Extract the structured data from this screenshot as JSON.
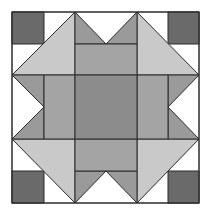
{
  "diagram": {
    "type": "quilt-block",
    "grid": {
      "cols": 6,
      "rows": 6,
      "x_lines": [
        12,
        44,
        75,
        106,
        137,
        168,
        199
      ],
      "y_lines": [
        12,
        44,
        75,
        107,
        139,
        171,
        203
      ]
    },
    "colors": {
      "background": "#ffffff",
      "corner_square": "#6a6a6a",
      "large_triangle": "#c9c9c9",
      "small_triangle": "#9a9a9a",
      "side_rect": "#a4a4a4",
      "center_square": "#8c8c8c",
      "outline": "#2a2a2a"
    },
    "pieces": {
      "corner_squares": [
        {
          "name": "corner-square-top-left",
          "points": "12,12 44,12 44,44 12,44"
        },
        {
          "name": "corner-square-top-right",
          "points": "168,12 199,12 199,44 168,44"
        },
        {
          "name": "corner-square-bottom-left",
          "points": "12,171 44,171 44,203 12,203"
        },
        {
          "name": "corner-square-bottom-right",
          "points": "168,171 199,171 199,203 168,203"
        }
      ],
      "large_triangles": [
        {
          "name": "large-triangle-top-left",
          "points": "75,12 12,75 75,75"
        },
        {
          "name": "large-triangle-top-right",
          "points": "137,12 199,75 137,75"
        },
        {
          "name": "large-triangle-bottom-left",
          "points": "12,139 75,139 75,203"
        },
        {
          "name": "large-triangle-bottom-right",
          "points": "137,139 199,139 137,203"
        }
      ],
      "small_triangles": [
        {
          "name": "small-triangle-top-a",
          "points": "75,12 106,44 75,44"
        },
        {
          "name": "small-triangle-top-b",
          "points": "137,12 137,44 106,44"
        },
        {
          "name": "small-triangle-bottom-a",
          "points": "75,171 106,171 75,203"
        },
        {
          "name": "small-triangle-bottom-b",
          "points": "106,171 137,171 137,203"
        },
        {
          "name": "small-triangle-left-a",
          "points": "12,75 44,75 44,107"
        },
        {
          "name": "small-triangle-left-b",
          "points": "44,107 44,139 12,139"
        },
        {
          "name": "small-triangle-right-a",
          "points": "168,75 199,75 168,107"
        },
        {
          "name": "small-triangle-right-b",
          "points": "168,107 199,139 168,139"
        }
      ],
      "side_rects": [
        {
          "name": "side-rect-top",
          "points": "75,44 137,44 137,75 75,75"
        },
        {
          "name": "side-rect-bottom",
          "points": "75,139 137,139 137,171 75,171"
        },
        {
          "name": "side-rect-left",
          "points": "44,75 75,75 75,139 44,139"
        },
        {
          "name": "side-rect-right",
          "points": "137,75 168,75 168,139 137,139"
        }
      ],
      "center_square": {
        "name": "center-square",
        "points": "75,75 137,75 137,139 75,139"
      }
    }
  }
}
